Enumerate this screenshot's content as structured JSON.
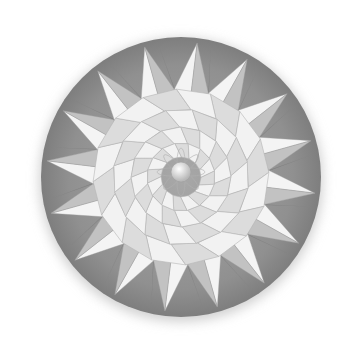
{
  "image": {
    "subject": "Geometric paper-fold rosette: a 16-point star on a grey disk with a spiral tessellation and a central sphere",
    "background": "#ffffff",
    "disk": {
      "cx": 181,
      "cy": 177,
      "r": 140,
      "color": "#8e8e8e",
      "edge": "#7a7a7a"
    },
    "star": {
      "points": 16,
      "outer_r": 135,
      "inner_r": 88,
      "light": "#f4f4f4",
      "shade": "#c2c2c2"
    },
    "inner_ring": {
      "r": 88,
      "color": "#ebebeb",
      "line": "#b5b5b5"
    },
    "center_sphere": {
      "r": 10,
      "color": "#d8d8d8"
    }
  }
}
